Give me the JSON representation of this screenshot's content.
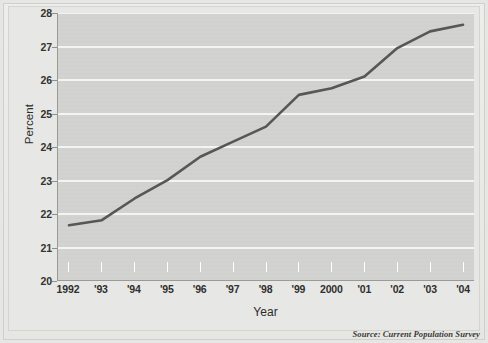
{
  "chart_data": {
    "type": "line",
    "title": "",
    "subtitle": "",
    "xlabel": "Year",
    "ylabel": "Percent",
    "categories": [
      "1992",
      "'93",
      "'94",
      "'95",
      "'96",
      "'97",
      "'98",
      "'99",
      "2000",
      "'01",
      "'02",
      "'03",
      "'04"
    ],
    "x": [
      1992,
      1993,
      1994,
      1995,
      1996,
      1997,
      1998,
      1999,
      2000,
      2001,
      2002,
      2003,
      2004
    ],
    "values": [
      21.65,
      21.8,
      22.45,
      23.0,
      23.7,
      24.15,
      24.6,
      25.55,
      25.75,
      26.1,
      26.95,
      27.45,
      27.65
    ],
    "series": [
      {
        "name": "Percent",
        "values": [
          21.65,
          21.8,
          22.45,
          23.0,
          23.7,
          24.15,
          24.6,
          25.55,
          25.75,
          26.1,
          26.95,
          27.45,
          27.65
        ]
      }
    ],
    "ylim": [
      20,
      28
    ],
    "xlim": [
      1992,
      2004
    ],
    "yticks": [
      20,
      21,
      22,
      23,
      24,
      25,
      26,
      27,
      28
    ],
    "ytick_labels": [
      "20",
      "21",
      "22",
      "23",
      "24",
      "25",
      "26",
      "27",
      "28"
    ],
    "grid": "horizontal",
    "legend": "none",
    "annotations": [
      "Source: Current Population Survey"
    ],
    "line_color": "#575755",
    "plot_background": "#d2d2d0",
    "gridline_color": "#f4f4f2",
    "figure_background": "#e6e6e4",
    "axis_color": "#9a9a97"
  },
  "axes": {
    "y_title": "Percent",
    "x_title": "Year"
  },
  "footer": {
    "source": "Source: Current Population Survey"
  }
}
